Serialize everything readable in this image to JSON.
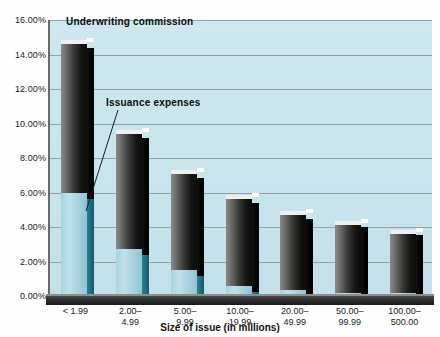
{
  "chart_data": {
    "type": "bar",
    "subtype": "stacked-3d-column",
    "title": "",
    "xlabel": "Size of issue (in millions)",
    "ylabel": "Costs ($)",
    "ylim": [
      0,
      16
    ],
    "yunit": "%",
    "ytick_labels": [
      "0.00%",
      "2.00%",
      "4.00%",
      "6.00%",
      "8.00%",
      "10.00%",
      "12.00%",
      "14.00%",
      "16.00%"
    ],
    "ytick_values": [
      0,
      2,
      4,
      6,
      8,
      10,
      12,
      14,
      16
    ],
    "grid": true,
    "legend_position": "inline-annotations",
    "categories": [
      "< 1.99",
      "2.00–\n4.99",
      "5.00–\n9.99",
      "10.00–\n19.99",
      "20.00–\n49.99",
      "50.00–\n99.99",
      "100.00–\n500.00"
    ],
    "series": [
      {
        "name": "Issuance expenses",
        "color": "#a9d3de",
        "values": [
          6.0,
          2.7,
          1.5,
          0.6,
          0.35,
          0.2,
          0.15
        ]
      },
      {
        "name": "Underwriting commission",
        "color": "#1b1b1a",
        "values": [
          8.6,
          6.7,
          5.6,
          5.0,
          4.35,
          3.9,
          3.45
        ]
      }
    ],
    "totals": [
      14.6,
      9.4,
      7.1,
      5.6,
      4.7,
      4.1,
      3.6
    ],
    "annotations": [
      {
        "text": "Underwriting commission",
        "target": "upper-segment"
      },
      {
        "text": "Issuance expenses",
        "target": "lower-segment"
      }
    ]
  },
  "colors": {
    "plot_background": "#c9e4ec",
    "gridline": "#7f8c90",
    "axis": "#2e2e2e",
    "issuance": "#a9d3de",
    "issuance_side": "#1d6b7e",
    "underwriting": "#1b1b1a",
    "text": "#101010"
  }
}
